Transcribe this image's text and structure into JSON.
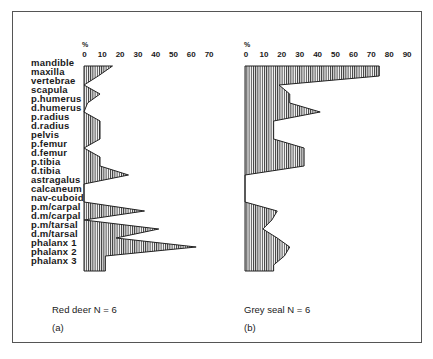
{
  "chart_data": [
    {
      "type": "area",
      "title": "Red deer  N = 6",
      "panel": "(a)",
      "xlabel": "%",
      "ylabel": "",
      "xlim": [
        0,
        70
      ],
      "xticks": [
        0,
        10,
        20,
        30,
        40,
        50,
        60,
        70
      ],
      "categories": [
        "mandible",
        "maxilla",
        "vertebrae",
        "scapula",
        "p.humerus",
        "d.humerus",
        "p.radius",
        "d.radius",
        "pelvis",
        "p.femur",
        "d.femur",
        "p.tibia",
        "d.tibia",
        "astragalus",
        "calcaneum",
        "nav-cuboid",
        "p.m/carpal",
        "d.m/carpal",
        "p.m/tarsal",
        "d.m/tarsal",
        "phalanx 1",
        "phalanx 2",
        "phalanx 3"
      ],
      "values": [
        16,
        8,
        0,
        9,
        2,
        0,
        9,
        9,
        9,
        0,
        9,
        9,
        25,
        0,
        0,
        0,
        34,
        0,
        42,
        18,
        63,
        12,
        12
      ]
    },
    {
      "type": "area",
      "title": "Grey seal  N = 6",
      "panel": "(b)",
      "xlabel": "%",
      "ylabel": "",
      "xlim": [
        0,
        90
      ],
      "xticks": [
        0,
        10,
        20,
        30,
        40,
        50,
        60,
        70,
        80,
        90
      ],
      "categories": [
        "mandible",
        "maxilla",
        "vertebrae",
        "scapula",
        "p.humerus",
        "d.humerus",
        "p.radius",
        "d.radius",
        "pelvis",
        "p.femur",
        "d.femur",
        "p.tibia",
        "d.tibia",
        "astragalus",
        "calcaneum",
        "nav-cuboid",
        "p.m/carpal",
        "d.m/carpal",
        "p.m/tarsal",
        "d.m/tarsal",
        "phalanx 1",
        "phalanx 2",
        "phalanx 3"
      ],
      "values": [
        75,
        75,
        19,
        25,
        25,
        42,
        16,
        16,
        16,
        33,
        33,
        33,
        0,
        0,
        0,
        0,
        18,
        15,
        10,
        18,
        25,
        22,
        16
      ]
    }
  ],
  "labels": {
    "pct_symbol": "%",
    "deer_caption": "Red deer  N = 6",
    "deer_panel": "(a)",
    "seal_caption": "Grey seal  N = 6",
    "seal_panel": "(b)"
  },
  "deer_ticks": [
    "0",
    "10",
    "20",
    "30",
    "40",
    "50",
    "60",
    "70"
  ],
  "seal_ticks": [
    "0",
    "10",
    "20",
    "30",
    "40",
    "50",
    "60",
    "70",
    "80",
    "90"
  ],
  "elements": [
    "mandible",
    "maxilla",
    "vertebrae",
    "scapula",
    "p.humerus",
    "d.humerus",
    "p.radius",
    "d.radius",
    "pelvis",
    "p.femur",
    "d.femur",
    "p.tibia",
    "d.tibia",
    "astragalus",
    "calcaneum",
    "nav-cuboid",
    "p.m/carpal",
    "d.m/carpal",
    "p.m/tarsal",
    "d.m/tarsal",
    "phalanx 1",
    "phalanx 2",
    "phalanx 3"
  ]
}
